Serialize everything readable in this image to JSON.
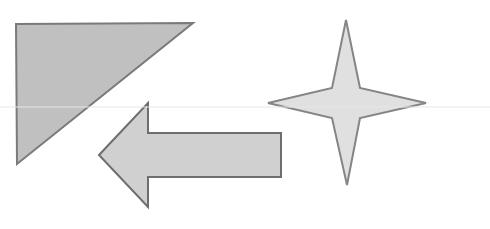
{
  "canvas": {
    "width": 490,
    "height": 229,
    "background": "#ffffff"
  },
  "guideline": {
    "y": 107,
    "color": "#e6e6e6"
  },
  "shapes": {
    "triangle": {
      "points": "16,24 193,23 17,164",
      "fill": "#c0c0c0",
      "stroke": "#7a7a7a"
    },
    "arrow": {
      "points": "99,155 148,103 148,133 281,133 281,177 148,177 148,207",
      "fill": "#d0d0d0",
      "stroke": "#6e6e6e"
    },
    "star": {
      "points": "346,20 360,88 426,103 360,118 347,185 332,118 268,103 332,88",
      "fill": "#e0e0e0",
      "stroke": "#858585"
    }
  }
}
